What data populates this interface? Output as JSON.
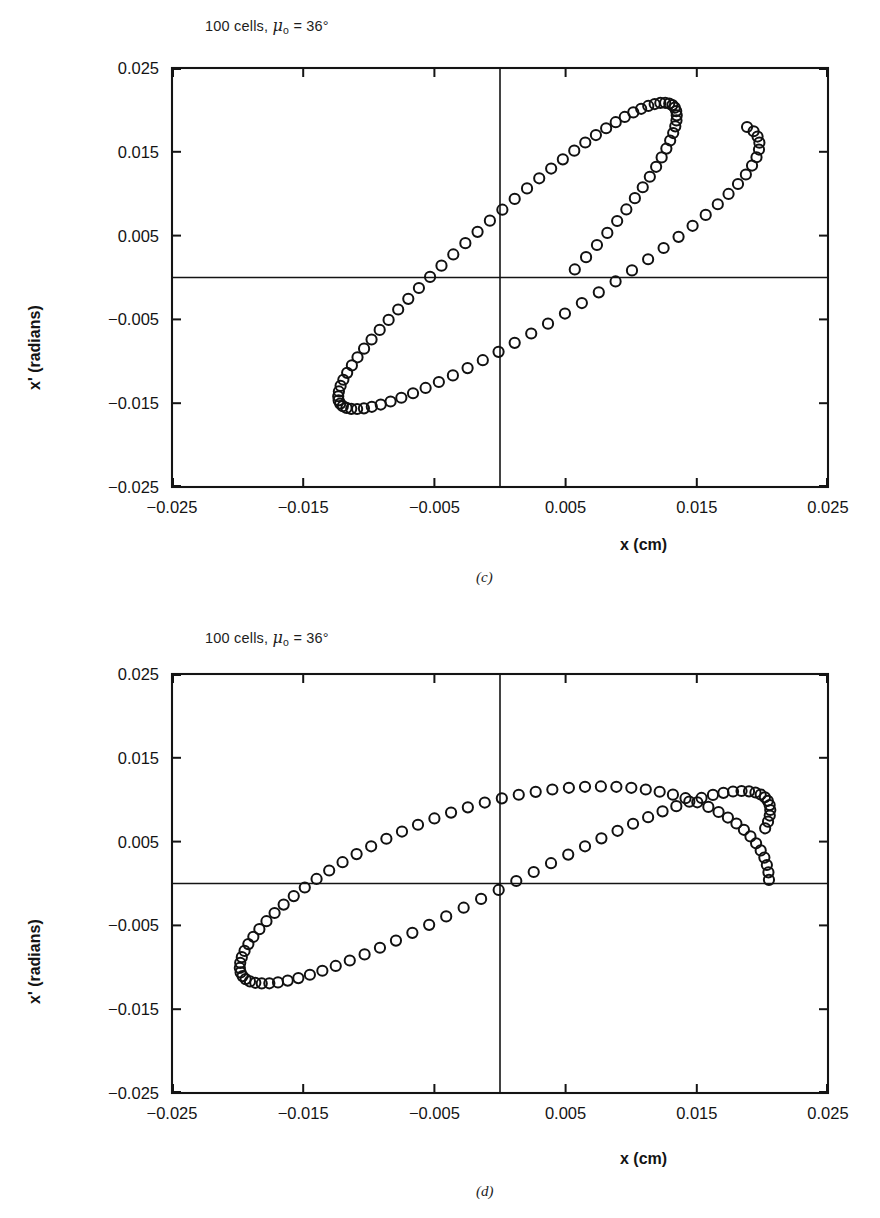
{
  "figure": {
    "panels": [
      {
        "id": "c",
        "letter": "(c)",
        "title_prefix": "100 cells, ",
        "title_symbol": "μ",
        "title_subscript": "o",
        "title_suffix": " = 36°",
        "title_plain": "100 cells, μₒ = 36°"
      },
      {
        "id": "d",
        "letter": "(d)",
        "title_prefix": "100 cells, ",
        "title_symbol": "μ",
        "title_subscript": "o",
        "title_suffix": " = 36°",
        "title_plain": "100 cells, μₒ = 36°"
      }
    ],
    "axes": {
      "xlabel": "x (cm)",
      "ylabel": "x' (radians)",
      "xticks": [
        "-0.025",
        "-0.015",
        "-0.005",
        "0.005",
        "0.015",
        "0.025"
      ],
      "yticks": [
        "0.025",
        "0.015",
        "0.005",
        "-0.005",
        "-0.015",
        "-0.025"
      ]
    },
    "colors": {
      "ink": "#141414",
      "marker_stroke": "#111111",
      "background": "#ffffff"
    }
  },
  "chart_data": [
    {
      "type": "scatter",
      "panel": "c",
      "title": "100 cells, μₒ = 36°",
      "xlabel": "x (cm)",
      "ylabel": "x' (radians)",
      "xlim": [
        -0.025,
        0.025
      ],
      "ylim": [
        -0.025,
        0.025
      ],
      "xticks": [
        -0.025,
        -0.015,
        -0.005,
        0.005,
        0.015,
        0.025
      ],
      "yticks": [
        -0.025,
        -0.015,
        -0.005,
        0.005,
        0.015,
        0.025
      ],
      "grid": false,
      "legend": "none",
      "marker": "open-circle",
      "n_points": 100,
      "description": "Tilted (correlated) phase-space ellipse; major axis sloping up to the right; points bunch at the two turning points.",
      "ellipse": {
        "center_x": 0.0,
        "center_y": 0.0,
        "semi_major": 0.0265,
        "semi_minor": 0.0062,
        "tilt_deg": 36.0
      },
      "x": [
        0.01883,
        0.01933,
        0.01963,
        0.01977,
        0.01974,
        0.01955,
        0.01921,
        0.01874,
        0.01814,
        0.01742,
        0.0166,
        0.01568,
        0.01468,
        0.01361,
        0.01247,
        0.01129,
        0.01006,
        0.00881,
        0.00753,
        0.00624,
        0.00495,
        0.00366,
        0.00238,
        0.00112,
        -0.00011,
        -0.00131,
        -0.00247,
        -0.00359,
        -0.00466,
        -0.00567,
        -0.00663,
        -0.00752,
        -0.00834,
        -0.00909,
        -0.00977,
        -0.01037,
        -0.01089,
        -0.01134,
        -0.0117,
        -0.01198,
        -0.01218,
        -0.0123,
        -0.01233,
        -0.01228,
        -0.01215,
        -0.01194,
        -0.01165,
        -0.01129,
        -0.01086,
        -0.01036,
        -0.00979,
        -0.00917,
        -0.00849,
        -0.00776,
        -0.00699,
        -0.00618,
        -0.00533,
        -0.00446,
        -0.00356,
        -0.00264,
        -0.00171,
        -0.00077,
        0.00018,
        0.00112,
        0.00206,
        0.00299,
        0.0039,
        0.00479,
        0.00566,
        0.0065,
        0.00731,
        0.00809,
        0.00882,
        0.00951,
        0.01016,
        0.01076,
        0.0113,
        0.01179,
        0.01222,
        0.01259,
        0.0129,
        0.01314,
        0.01332,
        0.01343,
        0.01347,
        0.01345,
        0.01336,
        0.0132,
        0.01297,
        0.01268,
        0.01232,
        0.0119,
        0.01142,
        0.01088,
        0.01028,
        0.00963,
        0.00893,
        0.00818,
        0.00739,
        0.00656,
        0.0057
      ],
      "y": [
        0.01796,
        0.01745,
        0.01682,
        0.01609,
        0.01527,
        0.01435,
        0.01336,
        0.01229,
        0.01116,
        0.00997,
        0.00874,
        0.00747,
        0.00617,
        0.00485,
        0.00352,
        0.00218,
        0.00085,
        -0.00047,
        -0.00177,
        -0.00305,
        -0.0043,
        -0.00551,
        -0.00668,
        -0.0078,
        -0.00887,
        -0.00987,
        -0.01081,
        -0.01168,
        -0.01247,
        -0.01318,
        -0.01381,
        -0.01435,
        -0.0148,
        -0.01516,
        -0.01543,
        -0.01561,
        -0.01569,
        -0.01567,
        -0.01556,
        -0.01535,
        -0.01505,
        -0.01466,
        -0.01417,
        -0.0136,
        -0.01294,
        -0.0122,
        -0.01138,
        -0.01049,
        -0.00952,
        -0.00849,
        -0.0074,
        -0.00625,
        -0.00506,
        -0.00382,
        -0.00255,
        -0.00125,
        7e-05,
        0.00141,
        0.00275,
        0.0041,
        0.00545,
        0.00678,
        0.00809,
        0.00938,
        0.01063,
        0.01184,
        0.013,
        0.0141,
        0.01514,
        0.01611,
        0.017,
        0.01781,
        0.01853,
        0.01916,
        0.0197,
        0.02013,
        0.02047,
        0.0207,
        0.02083,
        0.02085,
        0.02076,
        0.02057,
        0.02027,
        0.01986,
        0.01935,
        0.01874,
        0.01804,
        0.01724,
        0.01635,
        0.01538,
        0.01433,
        0.01321,
        0.01202,
        0.01077,
        0.00947,
        0.00812,
        0.00674,
        0.00532,
        0.00388,
        0.00243,
        0.00096
      ]
    },
    {
      "type": "scatter",
      "panel": "d",
      "title": "100 cells, μₒ = 36°",
      "xlabel": "x (cm)",
      "ylabel": "x' (radians)",
      "xlim": [
        -0.025,
        0.025
      ],
      "ylim": [
        -0.025,
        0.025
      ],
      "xticks": [
        -0.025,
        -0.015,
        -0.005,
        0.005,
        0.015,
        0.025
      ],
      "yticks": [
        -0.025,
        -0.015,
        -0.005,
        0.005,
        0.015,
        0.025
      ],
      "grid": false,
      "legend": "none",
      "marker": "open-circle",
      "n_points": 100,
      "description": "Upright (uncorrelated) phase-space ellipse; wide in x, narrow in x'; points bunch at the left and right turning points.",
      "ellipse": {
        "center_x": 0.0,
        "center_y": 0.0,
        "semi_major": 0.0205,
        "semi_minor": 0.0095,
        "tilt_deg": 0.0
      },
      "x": [
        0.0205,
        0.02046,
        0.02034,
        0.02015,
        0.01987,
        0.01952,
        0.01909,
        0.01859,
        0.01802,
        0.01737,
        0.01666,
        0.01588,
        0.01504,
        0.01414,
        0.01318,
        0.01217,
        0.01111,
        0.01001,
        0.00887,
        0.00769,
        0.00648,
        0.00525,
        0.00399,
        0.00272,
        0.00143,
        0.00014,
        -0.00116,
        -0.00245,
        -0.00373,
        -0.005,
        -0.00625,
        -0.00747,
        -0.00866,
        -0.00982,
        -0.01093,
        -0.012,
        -0.01302,
        -0.01398,
        -0.01488,
        -0.01572,
        -0.01649,
        -0.01718,
        -0.0178,
        -0.01834,
        -0.0188,
        -0.01918,
        -0.01947,
        -0.01968,
        -0.0198,
        -0.01983,
        -0.01977,
        -0.01962,
        -0.01939,
        -0.01906,
        -0.01865,
        -0.01816,
        -0.01758,
        -0.01692,
        -0.01618,
        -0.01537,
        -0.01449,
        -0.01354,
        -0.01252,
        -0.01145,
        -0.01032,
        -0.00915,
        -0.00793,
        -0.00668,
        -0.0054,
        -0.0041,
        -0.00277,
        -0.00144,
        -0.0001,
        0.00124,
        0.00257,
        0.00389,
        0.0052,
        0.00648,
        0.00773,
        0.00896,
        0.01014,
        0.01129,
        0.01239,
        0.01344,
        0.01443,
        0.01536,
        0.01623,
        0.01703,
        0.01776,
        0.01841,
        0.01898,
        0.01947,
        0.01987,
        0.02019,
        0.02041,
        0.02055,
        0.0206,
        0.02056,
        0.02043,
        0.02021
      ],
      "y": [
        0.00044,
        0.00133,
        0.00221,
        0.00309,
        0.00395,
        0.0048,
        0.00562,
        0.00641,
        0.00716,
        0.00787,
        0.00853,
        0.00914,
        0.00969,
        0.01018,
        0.0106,
        0.01095,
        0.01122,
        0.01142,
        0.01154,
        0.01158,
        0.01154,
        0.01142,
        0.01122,
        0.01094,
        0.01059,
        0.01016,
        0.00966,
        0.00909,
        0.00846,
        0.00776,
        0.00701,
        0.0062,
        0.00534,
        0.00444,
        0.00351,
        0.00254,
        0.00155,
        0.00054,
        -0.00048,
        -0.0015,
        -0.00252,
        -0.00352,
        -0.0045,
        -0.00545,
        -0.00636,
        -0.00723,
        -0.00804,
        -0.00879,
        -0.00947,
        -0.01008,
        -0.01061,
        -0.01105,
        -0.01141,
        -0.01168,
        -0.01185,
        -0.01193,
        -0.01191,
        -0.0118,
        -0.01159,
        -0.01129,
        -0.01089,
        -0.01041,
        -0.00984,
        -0.00919,
        -0.00846,
        -0.00767,
        -0.00681,
        -0.00589,
        -0.00493,
        -0.00393,
        -0.00289,
        -0.00184,
        -0.00077,
        0.0003,
        0.00137,
        0.00242,
        0.00345,
        0.00444,
        0.00539,
        0.00629,
        0.00713,
        0.00791,
        0.00861,
        0.00923,
        0.00977,
        0.01021,
        0.01057,
        0.01082,
        0.01098,
        0.01104,
        0.011,
        0.01086,
        0.01062,
        0.01029,
        0.00987,
        0.00936,
        0.00877,
        0.00811,
        0.00738,
        0.00659
      ]
    }
  ]
}
